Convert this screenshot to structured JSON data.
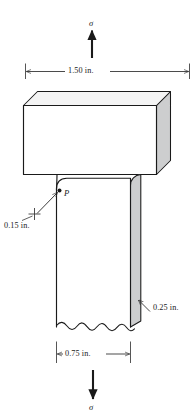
{
  "figure": {
    "type": "engineering-diagram",
    "canvas": {
      "width": 196,
      "height": 419
    },
    "colors": {
      "stroke": "#1a1a1a",
      "background": "#ffffff",
      "face_shade": "#c9cacb",
      "face_shade_light": "#dedfe0",
      "dimension_line": "#2b2b2b",
      "text": "#1a1a1a"
    }
  },
  "loads": {
    "top_stress_label": "σ",
    "bottom_stress_label": "σ",
    "top_arrow_direction": "up",
    "bottom_arrow_direction": "down"
  },
  "dimensions": [
    {
      "id": "flange-width",
      "value": "1.50 in.",
      "number": 1.5,
      "unit": "in.",
      "position": "top",
      "measures": "upper block width"
    },
    {
      "id": "stem-width",
      "value": "0.75 in.",
      "number": 0.75,
      "unit": "in.",
      "position": "bottom",
      "measures": "lower stem width"
    },
    {
      "id": "fillet-radius",
      "value": "0.15 in.",
      "number": 0.15,
      "unit": "in.",
      "position": "left",
      "measures": "fillet radius at point P"
    },
    {
      "id": "thickness",
      "value": "0.25 in.",
      "number": 0.25,
      "unit": "in.",
      "position": "right",
      "measures": "bar thickness"
    }
  ],
  "annotations": [
    {
      "id": "point-p",
      "label": "P",
      "type": "point-marker",
      "note": "stress concentration location at fillet"
    }
  ],
  "features": {
    "break_line": "wavy break at bottom of stem",
    "projection": "isometric with shaded side faces"
  }
}
